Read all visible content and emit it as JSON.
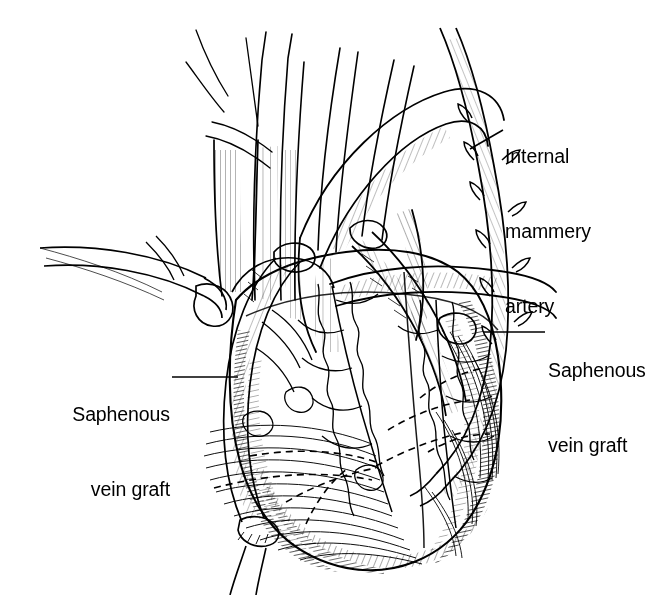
{
  "figure": {
    "style": "pen-and-ink line engraving",
    "ink_color": "#000000",
    "background_color": "#ffffff",
    "width": 668,
    "height": 595
  },
  "labels": {
    "internal_mammary_artery": {
      "line1": "Internal",
      "line2": "mammery",
      "line3": "artery",
      "full_text": "Internal mammery artery",
      "align": "left",
      "leader": {
        "x1": 470,
        "y1": 149,
        "x2": 503,
        "y2": 130
      }
    },
    "saphenous_vein_graft_right": {
      "line1": "Saphenous",
      "line2": "vein graft",
      "full_text": "Saphenous vein graft",
      "align": "left",
      "leader": {
        "x1": 483,
        "y1": 332,
        "x2": 545,
        "y2": 332
      }
    },
    "saphenous_vein_graft_left": {
      "line1": "Saphenous",
      "line2": "vein graft",
      "full_text": "Saphenous vein graft",
      "align": "right",
      "leader": {
        "x1": 172,
        "y1": 377,
        "x2": 238,
        "y2": 377
      }
    }
  },
  "anatomy": {
    "structures": [
      "aorta",
      "pulmonary trunk",
      "superior vena cava",
      "brachiocephalic trunk",
      "left common carotid artery",
      "left subclavian artery",
      "right atrium",
      "right ventricle",
      "left ventricle",
      "left anterior descending artery",
      "diagonal branch",
      "right coronary artery",
      "internal mammary artery graft",
      "saphenous vein graft to left system",
      "saphenous vein graft to right system",
      "epicardial fat",
      "proximal aortic anastomosis",
      "distal coronary anastomosis"
    ],
    "hidden_vessels_style": "dashed"
  }
}
